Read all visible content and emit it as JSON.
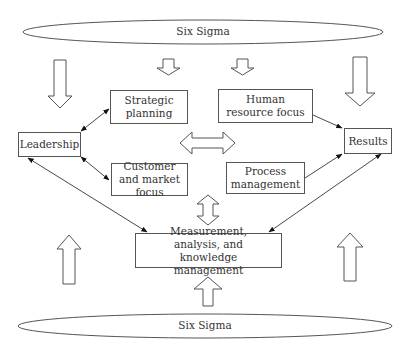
{
  "diagram": {
    "top_ellipse": {
      "label": "Six Sigma"
    },
    "bottom_ellipse": {
      "label": "Six Sigma"
    },
    "nodes": {
      "leadership": {
        "label": "Leadership"
      },
      "strategic_planning": {
        "label": "Strategic planning"
      },
      "customer_market_focus": {
        "label": "Customer and market focus"
      },
      "human_resource_focus": {
        "label": "Human resource focus"
      },
      "process_management": {
        "label": "Process management"
      },
      "results": {
        "label": "Results"
      },
      "measurement": {
        "label": "Measurement, analysis, and knowledge management"
      }
    },
    "edges": [
      {
        "from": "Leadership",
        "to": "Strategic planning",
        "type": "bidirectional"
      },
      {
        "from": "Leadership",
        "to": "Customer and market focus",
        "type": "bidirectional"
      },
      {
        "from": "Leadership",
        "to": "Measurement, analysis, and knowledge management",
        "type": "bidirectional"
      },
      {
        "from": "Human resource focus",
        "to": "Results",
        "type": "directed"
      },
      {
        "from": "Process management",
        "to": "Results",
        "type": "directed"
      },
      {
        "from": "Measurement, analysis, and knowledge management",
        "to": "Results",
        "type": "bidirectional"
      }
    ],
    "block_arrows": [
      {
        "position": "left-top",
        "direction": "down"
      },
      {
        "position": "center-left-top",
        "direction": "down"
      },
      {
        "position": "center-right-top",
        "direction": "down"
      },
      {
        "position": "right-top",
        "direction": "down"
      },
      {
        "position": "center",
        "direction": "left-right"
      },
      {
        "position": "center-lower",
        "direction": "up-down"
      },
      {
        "position": "left-bottom",
        "direction": "up"
      },
      {
        "position": "center-bottom",
        "direction": "up"
      },
      {
        "position": "right-bottom",
        "direction": "up"
      }
    ],
    "colors": {
      "stroke": "#555555",
      "text": "#333333",
      "background": "#ffffff"
    }
  }
}
